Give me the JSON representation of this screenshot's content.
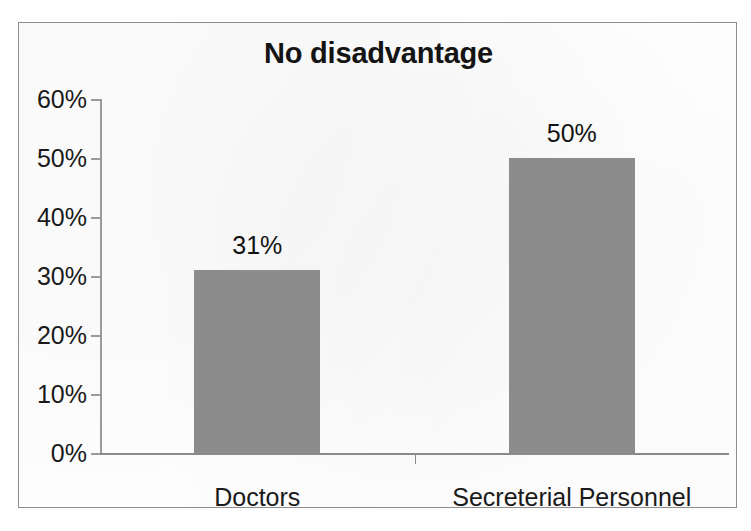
{
  "chart_data": {
    "type": "bar",
    "title": "No disadvantage",
    "xlabel": "",
    "ylabel": "",
    "categories": [
      "Doctors",
      "Secreterial Personnel"
    ],
    "values": [
      31,
      50
    ],
    "value_labels": [
      "31%",
      "50%"
    ],
    "ylim": [
      0,
      60
    ],
    "ytick_values": [
      60,
      50,
      40,
      30,
      20,
      10,
      0
    ],
    "ytick_labels": [
      "60%",
      "50%",
      "40%",
      "30%",
      "20%",
      "10%",
      "0%"
    ],
    "grid": false,
    "legend": "none",
    "bar_color": "#8c8c8c",
    "axis_color": "#8a8a8a",
    "text_color": "#1a1a1a",
    "border_color": "#8d8d8d",
    "background": "#ffffff",
    "units": "percent"
  }
}
